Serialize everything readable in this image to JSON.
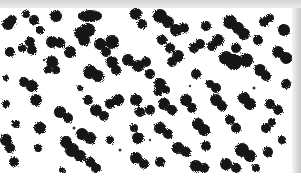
{
  "image": {
    "description": "Grayscale micrograph of dark irregular particle clusters on white background",
    "colors": {
      "background": "#ffffff",
      "particle": "#111111",
      "top_band": "#d8d8d8"
    },
    "width": 301,
    "height": 191
  }
}
